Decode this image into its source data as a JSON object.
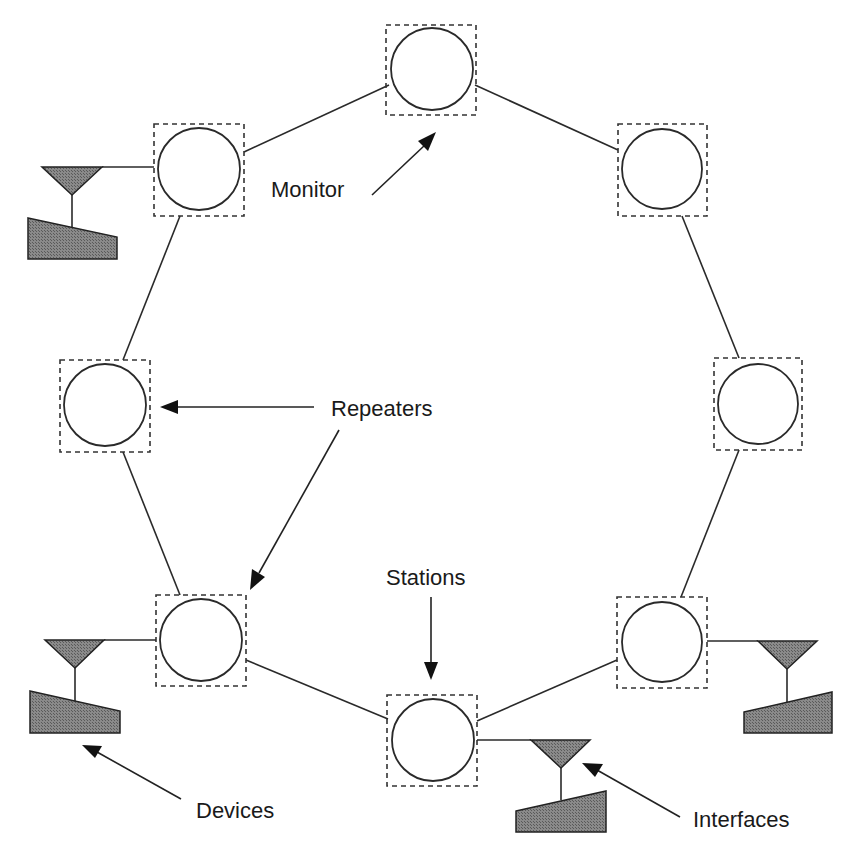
{
  "diagram": {
    "colors": {
      "line": "#2a2a2a",
      "device_fill": "#7a7a7a",
      "background": "#ffffff"
    },
    "labels": {
      "monitor": "Monitor",
      "repeaters": "Repeaters",
      "stations": "Stations",
      "devices": "Devices",
      "interfaces": "Interfaces"
    },
    "nodes": [
      {
        "id": "n1",
        "position": "top",
        "cx": 432,
        "cy": 69
      },
      {
        "id": "n2",
        "position": "upper-left",
        "cx": 198,
        "cy": 169
      },
      {
        "id": "n3",
        "position": "upper-right",
        "cx": 662,
        "cy": 169
      },
      {
        "id": "n4",
        "position": "left",
        "cx": 105,
        "cy": 405
      },
      {
        "id": "n5",
        "position": "right",
        "cx": 758,
        "cy": 404
      },
      {
        "id": "n6",
        "position": "lower-left",
        "cx": 200,
        "cy": 640
      },
      {
        "id": "n7",
        "position": "bottom",
        "cx": 433,
        "cy": 739
      },
      {
        "id": "n8",
        "position": "lower-right",
        "cx": 662,
        "cy": 642
      }
    ],
    "attached_devices": [
      "n2",
      "n6",
      "n7",
      "n8"
    ]
  }
}
